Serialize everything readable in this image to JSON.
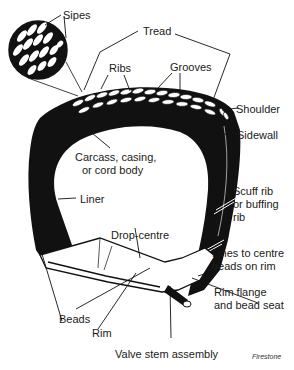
{
  "diagram": {
    "colors": {
      "ink": "#111111",
      "paper": "#ffffff",
      "text": "#1a1a1a"
    },
    "labels": {
      "sipes": "Sipes",
      "tread": "Tread",
      "ribs": "Ribs",
      "grooves": "Grooves",
      "shoulder": "Shoulder",
      "sidewall": "Sidewall",
      "carcass_1": "Carcass, casing,",
      "carcass_2": "or cord body",
      "liner": "Liner",
      "scuff_1": "Scuff rib",
      "scuff_2": "or buffing",
      "scuff_3": "rib",
      "drop_centre": "Drop-centre",
      "lines_1": "Lines to centre",
      "lines_2": "beads on rim",
      "flange_1": "Rim flange",
      "flange_2": "and bead seat",
      "beads": "Beads",
      "rim": "Rim",
      "valve": "Valve stem assembly"
    },
    "credit": "Firestone"
  }
}
